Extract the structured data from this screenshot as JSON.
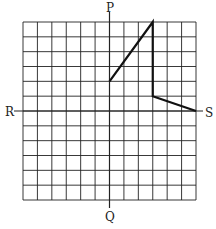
{
  "labels": {
    "top": "P",
    "bottom": "Q",
    "left": "R",
    "right": "S"
  },
  "grid": {
    "cols": 12,
    "rows": 12,
    "x_min": -6,
    "x_max": 6,
    "y_min": -6,
    "y_max": 6
  },
  "shape": {
    "type": "polyline",
    "points": [
      [
        0,
        2
      ],
      [
        3,
        6
      ],
      [
        3,
        1
      ],
      [
        6,
        0
      ]
    ],
    "color": "#111111"
  }
}
